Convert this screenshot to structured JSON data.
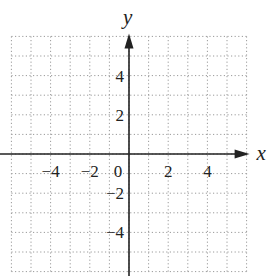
{
  "figure": {
    "type": "coordinate-plane",
    "x_axis_label": "x",
    "y_axis_label": "y",
    "x_range": [
      -6,
      6
    ],
    "y_range": [
      -6,
      6
    ],
    "grid_step": 1,
    "grid_style": "dotted",
    "x_tick_labels": [
      {
        "value": -4,
        "text": "−4"
      },
      {
        "value": -2,
        "text": "−2"
      },
      {
        "value": 0,
        "text": "0"
      },
      {
        "value": 2,
        "text": "2"
      },
      {
        "value": 4,
        "text": "4"
      }
    ],
    "y_tick_labels": [
      {
        "value": 4,
        "text": "4"
      },
      {
        "value": 2,
        "text": "2"
      },
      {
        "value": -2,
        "text": "−2"
      },
      {
        "value": -4,
        "text": "−4"
      }
    ],
    "colors": {
      "axis": "#222222",
      "grid": "#9a9a9a",
      "background": "#ffffff"
    }
  }
}
